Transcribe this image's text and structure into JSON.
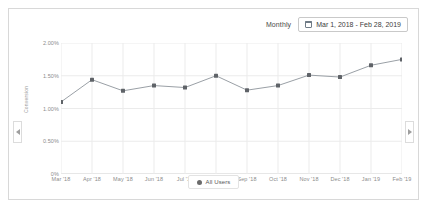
{
  "header": {
    "frequency_label": "Monthly",
    "calendar_icon": "calendar-icon",
    "date_range": "Mar 1, 2018 - Feb 28, 2019"
  },
  "controls": {
    "scroll_left_icon": "chevron-left-icon",
    "scroll_right_icon": "chevron-right-icon"
  },
  "legend": {
    "items": [
      {
        "label": "All Users",
        "color": "#6b6b6b"
      }
    ]
  },
  "colors": {
    "line": "#9aa0a6",
    "marker": "#5f6368",
    "grid": "#ebebeb",
    "axis_text": "#8c8c8c",
    "card_border": "#d8d8d8"
  },
  "chart_data": {
    "type": "line",
    "title": "",
    "xlabel": "",
    "ylabel": "Conversion",
    "ylim": [
      0,
      2.0
    ],
    "yticks": [
      0,
      0.5,
      1.0,
      1.5,
      2.0
    ],
    "ytick_labels": [
      "0%",
      "0.50%",
      "1.00%",
      "1.50%",
      "2.00%"
    ],
    "grid": true,
    "legend_position": "bottom",
    "categories": [
      "Mar '18",
      "Apr '18",
      "May '18",
      "Jun '18",
      "Jul '18",
      "Aug '18",
      "Sep '18",
      "Oct '18",
      "Nov '18",
      "Dec '18",
      "Jan '19",
      "Feb '19"
    ],
    "series": [
      {
        "name": "All Users",
        "color": "#9aa0a6",
        "values": [
          1.1,
          1.44,
          1.27,
          1.35,
          1.32,
          1.5,
          1.28,
          1.35,
          1.51,
          1.48,
          1.66,
          1.75
        ]
      }
    ]
  }
}
